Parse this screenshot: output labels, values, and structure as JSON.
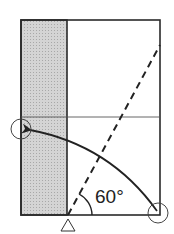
{
  "diagram": {
    "type": "paper-folding-instruction",
    "angle_label": "60°",
    "colors": {
      "line": "#2a2a2a",
      "shaded_strip": "#c8c8c8",
      "background": "#ffffff"
    },
    "elements": [
      {
        "name": "paper-outline",
        "desc": "rectangular sheet"
      },
      {
        "name": "shaded-strip",
        "desc": "folded strip on the left, shown shaded"
      },
      {
        "name": "horizontal-crease",
        "desc": "horizontal reference line"
      },
      {
        "name": "fold-line",
        "desc": "dashed diagonal valley fold at 60 degrees"
      },
      {
        "name": "fold-arrow",
        "desc": "curved arrow from bottom-right corner to left edge"
      },
      {
        "name": "start-circle",
        "desc": "circle marking bottom-right corner"
      },
      {
        "name": "target-circle",
        "desc": "circle marking target point on left edge"
      },
      {
        "name": "pivot-triangle",
        "desc": "triangle marker below the fold origin"
      }
    ]
  }
}
